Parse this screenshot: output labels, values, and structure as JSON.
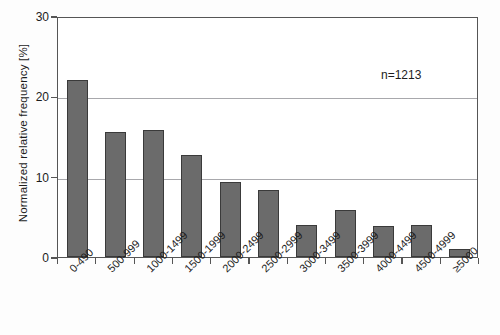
{
  "chart_data": {
    "type": "bar",
    "title": "",
    "xlabel": "",
    "ylabel": "Normalized relative frequency [%]",
    "ylim": [
      0,
      30
    ],
    "yticks": [
      0,
      10,
      20,
      30
    ],
    "grid": true,
    "legend": null,
    "annotations": [
      {
        "name": "sample-size",
        "text": "n=1213"
      }
    ],
    "categories": [
      "0-490",
      "500-999",
      "1000-1499",
      "1500-1999",
      "2000-2499",
      "2500-2999",
      "3000-3499",
      "3500-3999",
      "4000-4499",
      "4500-4999",
      "≥5000"
    ],
    "values": [
      22.0,
      15.6,
      15.8,
      12.7,
      9.3,
      8.4,
      4.0,
      5.8,
      3.8,
      4.0,
      1.0
    ],
    "series": [
      {
        "name": "Normalized relative frequency",
        "values": [
          22.0,
          15.6,
          15.8,
          12.7,
          9.3,
          8.4,
          4.0,
          5.8,
          3.8,
          4.0,
          1.0
        ]
      }
    ]
  },
  "colors": {
    "bar_fill": "#6b6b6b",
    "bar_edge": "#3a3a3a",
    "gridline": "#a8a8ac",
    "axis": "#555555",
    "background": "#fdfdfd",
    "plot_background": "#ffffff",
    "text": "#1c1c1c"
  }
}
